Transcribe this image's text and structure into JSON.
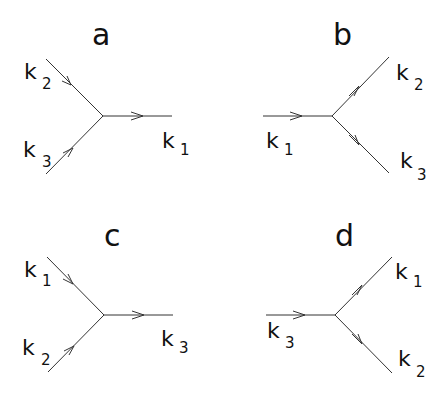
{
  "diagram": {
    "panels": [
      {
        "id": "a",
        "title": "a",
        "type": "merge",
        "vertex": [
          103,
          116
        ],
        "legs": [
          {
            "label": "k",
            "sub": "2",
            "from": [
              46,
              59
            ],
            "to": [
              103,
              116
            ],
            "direction": "in"
          },
          {
            "label": "k",
            "sub": "3",
            "from": [
              46,
              174
            ],
            "to": [
              103,
              116
            ],
            "direction": "in"
          },
          {
            "label": "k",
            "sub": "1",
            "from": [
              103,
              116
            ],
            "to": [
              172,
              116
            ],
            "direction": "out"
          }
        ]
      },
      {
        "id": "b",
        "title": "b",
        "type": "split",
        "vertex": [
          332,
          116
        ],
        "legs": [
          {
            "label": "k",
            "sub": "1",
            "from": [
              263,
              116
            ],
            "to": [
              332,
              116
            ],
            "direction": "in"
          },
          {
            "label": "k",
            "sub": "2",
            "from": [
              332,
              116
            ],
            "to": [
              389,
              57
            ],
            "direction": "out"
          },
          {
            "label": "k",
            "sub": "3",
            "from": [
              332,
              116
            ],
            "to": [
              389,
              173
            ],
            "direction": "out"
          }
        ]
      },
      {
        "id": "c",
        "title": "c",
        "type": "merge",
        "vertex": [
          104,
          315
        ],
        "legs": [
          {
            "label": "k",
            "sub": "1",
            "from": [
              47,
              257
            ],
            "to": [
              104,
              315
            ],
            "direction": "in"
          },
          {
            "label": "k",
            "sub": "2",
            "from": [
              48,
              372
            ],
            "to": [
              104,
              315
            ],
            "direction": "in"
          },
          {
            "label": "k",
            "sub": "3",
            "from": [
              104,
              315
            ],
            "to": [
              173,
              315
            ],
            "direction": "out"
          }
        ]
      },
      {
        "id": "d",
        "title": "d",
        "type": "split",
        "vertex": [
          335,
          315
        ],
        "legs": [
          {
            "label": "k",
            "sub": "3",
            "from": [
              266,
              315
            ],
            "to": [
              335,
              315
            ],
            "direction": "in"
          },
          {
            "label": "k",
            "sub": "1",
            "from": [
              335,
              315
            ],
            "to": [
              392,
              257
            ],
            "direction": "out"
          },
          {
            "label": "k",
            "sub": "2",
            "from": [
              335,
              315
            ],
            "to": [
              392,
              373
            ],
            "direction": "out"
          }
        ]
      }
    ],
    "labels": {
      "a": {
        "title": "a",
        "k2": "k",
        "k2_sub": "2",
        "k3": "k",
        "k3_sub": "3",
        "k1": "k",
        "k1_sub": "1"
      },
      "b": {
        "title": "b",
        "k1": "k",
        "k1_sub": "1",
        "k2": "k",
        "k2_sub": "2",
        "k3": "k",
        "k3_sub": "3"
      },
      "c": {
        "title": "c",
        "k1": "k",
        "k1_sub": "1",
        "k2": "k",
        "k2_sub": "2",
        "k3": "k",
        "k3_sub": "3"
      },
      "d": {
        "title": "d",
        "k3": "k",
        "k3_sub": "3",
        "k1": "k",
        "k1_sub": "1",
        "k2": "k",
        "k2_sub": "2"
      }
    },
    "colors": {
      "line": "#333333",
      "text": "#111111",
      "background": "#ffffff"
    }
  }
}
